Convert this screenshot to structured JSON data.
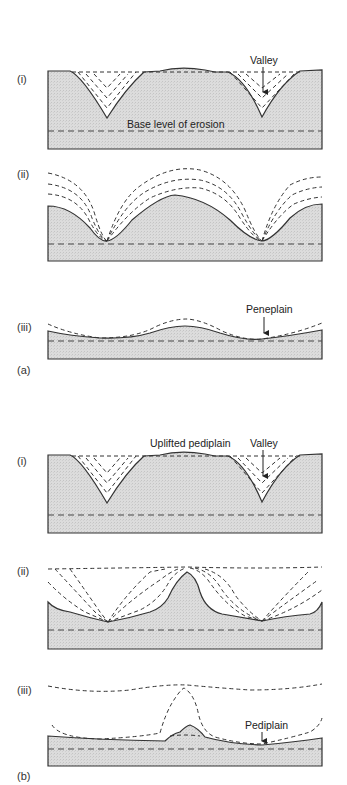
{
  "figure": {
    "colors": {
      "ground_fill": "#d9d9d9",
      "line": "#333333",
      "background": "#ffffff"
    },
    "part_a": {
      "label": "(a)",
      "stages": [
        {
          "label": "(i)",
          "annotations": [
            "Valley",
            "Base level of erosion"
          ]
        },
        {
          "label": "(ii)",
          "annotations": []
        },
        {
          "label": "(iii)",
          "annotations": [
            "Peneplain"
          ]
        }
      ]
    },
    "part_b": {
      "label": "(b)",
      "stages": [
        {
          "label": "(i)",
          "annotations": [
            "Uplifted pediplain",
            "Valley"
          ]
        },
        {
          "label": "(ii)",
          "annotations": []
        },
        {
          "label": "(iii)",
          "annotations": [
            "Pediplain"
          ]
        }
      ]
    },
    "legend": {
      "solid_line": "current land surface",
      "dashed_lines": "former/future surfaces",
      "horizontal_dashed": "base level of erosion"
    }
  }
}
